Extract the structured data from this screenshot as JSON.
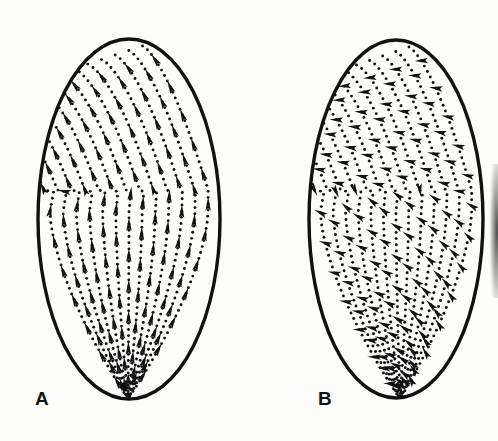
{
  "figure": {
    "kind": "scientific-line-drawing",
    "background_color": "#fdfdfb",
    "ink_color": "#111111",
    "panels": [
      {
        "id": "A",
        "label": "A",
        "label_x": 35,
        "label_y": 389,
        "ellipse": {
          "cx": 129,
          "cy": 219,
          "rx": 92,
          "ry": 181
        },
        "arrow_mode": "tangential",
        "arrow_note": "arrows lie along the dotted contour lines",
        "upper_field": "diagonal bands running up-to-the-right",
        "lower_field": "vertical streamlines converging to the bottom apex",
        "bend_y": 190,
        "apex_x": 128,
        "apex_y": 399
      },
      {
        "id": "B",
        "label": "B",
        "label_x": 318,
        "label_y": 389,
        "ellipse": {
          "cx": 396,
          "cy": 219,
          "rx": 88,
          "ry": 180
        },
        "arrow_mode": "transverse",
        "arrow_note": "arrows cross the dotted contour lines at a steep angle",
        "upper_field": "diagonal bands running up-to-the-right",
        "lower_field": "vertical streamlines converging to the bottom apex",
        "bend_y": 190,
        "apex_x": 400,
        "apex_y": 399
      }
    ],
    "artifact": {
      "name": "scan-edge-smudge",
      "x": 488,
      "y": 168,
      "width": 10,
      "height": 126
    }
  }
}
